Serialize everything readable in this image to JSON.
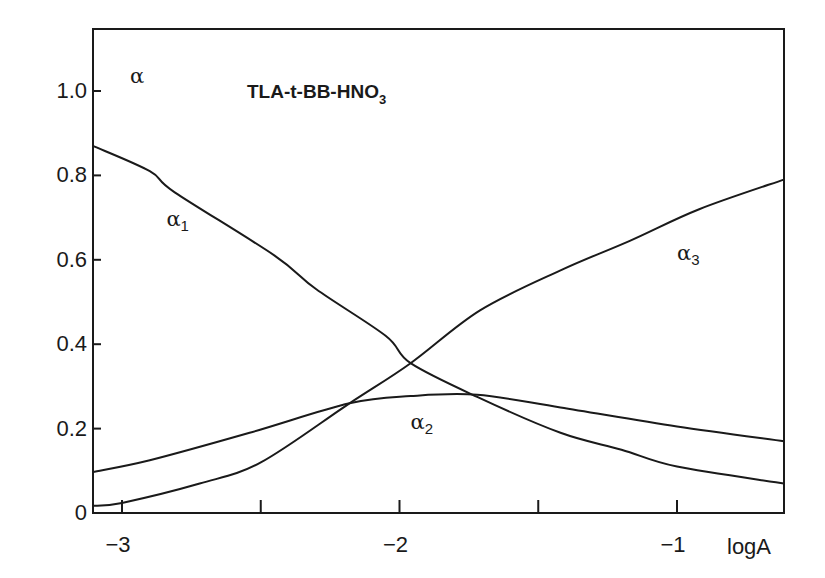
{
  "chart_data": {
    "type": "line",
    "title": "TLA-t-BB-HNO3",
    "title_main": "TLA-t-BB-HNO",
    "title_subscript": "3",
    "xlabel": "logA",
    "ylabel": "α",
    "xlim": [
      -3.105,
      -0.615
    ],
    "ylim": [
      0,
      1.15
    ],
    "grid": false,
    "legend": "none (curves labeled inline)",
    "x_ticks": [
      -3,
      -2.5,
      -2,
      -1.5,
      -1
    ],
    "x_tick_labels": [
      "−3",
      "",
      "−2",
      "",
      "−1"
    ],
    "y_ticks": [
      0,
      0.2,
      0.4,
      0.6,
      0.8,
      1.0
    ],
    "y_tick_labels": [
      "0",
      "0.2",
      "0.4",
      "0.6",
      "0.8",
      "1.0"
    ],
    "series": [
      {
        "name": "α1",
        "label_base": "α",
        "label_sub": "1",
        "label_pos": [
          -2.84,
          0.68
        ],
        "x": [
          -3.105,
          -2.9,
          -2.81,
          -2.45,
          -2.3,
          -2.05,
          -1.96,
          -1.72,
          -1.42,
          -1.2,
          -1.0,
          -0.615
        ],
        "values": [
          0.87,
          0.81,
          0.76,
          0.61,
          0.53,
          0.42,
          0.355,
          0.275,
          0.19,
          0.15,
          0.11,
          0.07
        ]
      },
      {
        "name": "α2",
        "label_base": "α",
        "label_sub": "2",
        "label_pos": [
          -1.96,
          0.2
        ],
        "x": [
          -3.105,
          -2.9,
          -2.54,
          -2.18,
          -1.96,
          -1.72,
          -1.42,
          -1.0,
          -0.615
        ],
        "values": [
          0.097,
          0.125,
          0.19,
          0.26,
          0.277,
          0.28,
          0.25,
          0.205,
          0.17
        ]
      },
      {
        "name": "α3",
        "label_base": "α",
        "label_sub": "3",
        "label_pos": [
          -1.0,
          0.6
        ],
        "x": [
          -3.105,
          -3.0,
          -2.72,
          -2.5,
          -2.18,
          -1.96,
          -1.71,
          -1.42,
          -1.17,
          -0.92,
          -0.615
        ],
        "values": [
          0.017,
          0.024,
          0.07,
          0.12,
          0.26,
          0.355,
          0.48,
          0.575,
          0.645,
          0.72,
          0.79
        ]
      }
    ],
    "annotations": [
      {
        "text": "α",
        "pos": [
          -2.88,
          1.02
        ],
        "role": "y-axis symbol"
      }
    ]
  }
}
